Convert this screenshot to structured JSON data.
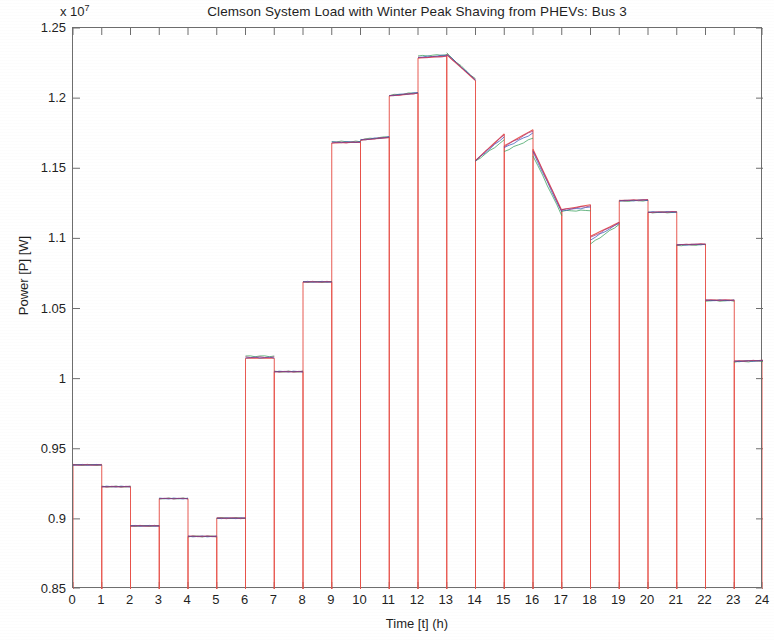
{
  "chart_data": {
    "type": "line",
    "title": "Clemson System Load with Winter Peak Shaving from PHEVs: Bus 3",
    "xlabel": "Time [t] (h)",
    "ylabel": "Power [P] [W]",
    "y_exponent_label": "x 10",
    "y_exponent_power": "7",
    "y_exponent_value": 10000000,
    "xlim": [
      0,
      24
    ],
    "ylim": [
      0.85,
      1.25
    ],
    "y_unit_note": "values in units of 1e7 W",
    "grid": false,
    "legend": "none",
    "xticks": [
      0,
      1,
      2,
      3,
      4,
      5,
      6,
      7,
      8,
      9,
      10,
      11,
      12,
      13,
      14,
      15,
      16,
      17,
      18,
      19,
      20,
      21,
      22,
      23,
      24
    ],
    "xtick_labels": [
      "0",
      "1",
      "2",
      "3",
      "4",
      "5",
      "6",
      "7",
      "8",
      "9",
      "10",
      "11",
      "12",
      "13",
      "14",
      "15",
      "16",
      "17",
      "18",
      "19",
      "20",
      "21",
      "22",
      "23",
      "24"
    ],
    "yticks": [
      0.85,
      0.9,
      0.95,
      1.0,
      1.05,
      1.1,
      1.15,
      1.2,
      1.25
    ],
    "ytick_labels": [
      "0.85",
      "0.9",
      "0.95",
      "1",
      "1.05",
      "1.1",
      "1.15",
      "1.2",
      "1.25"
    ],
    "colors": {
      "base_red": "#e8524a",
      "series_green": "#2e9b53",
      "series_blue": "#2c4fb5",
      "series_magenta": "#a8307c",
      "series_dark": "#4a4a4a",
      "axis": "#6e6e6e",
      "text": "#1f1f1f"
    },
    "hours": [
      {
        "hour": 0,
        "start": 0,
        "end": 1
      },
      {
        "hour": 1,
        "start": 1,
        "end": 2
      },
      {
        "hour": 2,
        "start": 2,
        "end": 3
      },
      {
        "hour": 3,
        "start": 3,
        "end": 4
      },
      {
        "hour": 4,
        "start": 4,
        "end": 5
      },
      {
        "hour": 5,
        "start": 5,
        "end": 6
      },
      {
        "hour": 6,
        "start": 6,
        "end": 7
      },
      {
        "hour": 7,
        "start": 7,
        "end": 8
      },
      {
        "hour": 8,
        "start": 8,
        "end": 9
      },
      {
        "hour": 9,
        "start": 9,
        "end": 10
      },
      {
        "hour": 10,
        "start": 10,
        "end": 11
      },
      {
        "hour": 11,
        "start": 11,
        "end": 12
      },
      {
        "hour": 12,
        "start": 12,
        "end": 13
      },
      {
        "hour": 13,
        "start": 13,
        "end": 14
      },
      {
        "hour": 14,
        "start": 14,
        "end": 15
      },
      {
        "hour": 15,
        "start": 15,
        "end": 16
      },
      {
        "hour": 16,
        "start": 16,
        "end": 17
      },
      {
        "hour": 17,
        "start": 17,
        "end": 18
      },
      {
        "hour": 18,
        "start": 18,
        "end": 19
      },
      {
        "hour": 19,
        "start": 19,
        "end": 20
      },
      {
        "hour": 20,
        "start": 20,
        "end": 21
      },
      {
        "hour": 21,
        "start": 21,
        "end": 22
      },
      {
        "hour": 22,
        "start": 22,
        "end": 23
      },
      {
        "hour": 23,
        "start": 23,
        "end": 24
      }
    ],
    "series": [
      {
        "name": "base-load",
        "color": "#e8524a",
        "style": "step-start",
        "values": [
          0.9385,
          0.923,
          0.895,
          0.9145,
          0.8875,
          0.9005,
          1.0145,
          1.005,
          1.069,
          1.168,
          1.17,
          1.2015,
          1.2285,
          1.231,
          1.1555,
          1.166,
          1.1635,
          1.1205,
          1.1015,
          1.127,
          1.1185,
          1.0955,
          1.056,
          1.0125
        ],
        "values_end": [
          0.9385,
          0.923,
          0.895,
          0.9145,
          0.8875,
          0.9005,
          1.0145,
          1.005,
          1.069,
          1.1685,
          1.172,
          1.2035,
          1.23,
          1.2125,
          1.1745,
          1.1775,
          1.12,
          1.124,
          1.1115,
          1.1275,
          1.119,
          1.096,
          1.056,
          1.013
        ]
      },
      {
        "name": "phev-shaved-green",
        "color": "#2e9b53",
        "style": "step-start",
        "values": [
          0.9385,
          0.923,
          0.895,
          0.9145,
          0.8875,
          0.9005,
          1.016,
          1.005,
          1.069,
          1.169,
          1.1705,
          1.202,
          1.23,
          1.232,
          1.155,
          1.162,
          1.159,
          1.1195,
          1.096,
          1.1265,
          1.1185,
          1.095,
          1.0555,
          1.012
        ],
        "values_end": [
          0.9385,
          0.923,
          0.895,
          0.9145,
          0.8875,
          0.9005,
          1.016,
          1.005,
          1.069,
          1.169,
          1.1725,
          1.204,
          1.231,
          1.2135,
          1.17,
          1.1715,
          1.1165,
          1.12,
          1.11,
          1.127,
          1.1185,
          1.0955,
          1.0555,
          1.0125
        ]
      },
      {
        "name": "phev-shaved-blue",
        "color": "#2c4fb5",
        "style": "step-start",
        "values": [
          0.9385,
          0.923,
          0.895,
          0.9145,
          0.8875,
          0.9005,
          1.015,
          1.005,
          1.069,
          1.1685,
          1.1702,
          1.2018,
          1.2292,
          1.2315,
          1.1553,
          1.1645,
          1.1615,
          1.12,
          1.099,
          1.1268,
          1.1187,
          1.0953,
          1.0558,
          1.0123
        ],
        "values_end": [
          0.9385,
          0.923,
          0.895,
          0.9145,
          0.8875,
          0.9005,
          1.015,
          1.005,
          1.069,
          1.1688,
          1.1723,
          1.2038,
          1.2305,
          1.213,
          1.1725,
          1.175,
          1.1185,
          1.1222,
          1.1108,
          1.1273,
          1.1188,
          1.0958,
          1.0558,
          1.0128
        ]
      },
      {
        "name": "phev-shaved-magenta",
        "color": "#a8307c",
        "style": "step-start",
        "values": [
          0.9385,
          0.923,
          0.895,
          0.9145,
          0.8875,
          0.9005,
          1.0152,
          1.005,
          1.069,
          1.1683,
          1.1701,
          1.2016,
          1.2288,
          1.2312,
          1.1556,
          1.1655,
          1.1628,
          1.1203,
          1.1005,
          1.1269,
          1.1186,
          1.0954,
          1.0559,
          1.0124
        ],
        "values_end": [
          0.9385,
          0.923,
          0.895,
          0.9145,
          0.8875,
          0.9005,
          1.0152,
          1.005,
          1.069,
          1.1686,
          1.1721,
          1.2036,
          1.2298,
          1.2128,
          1.1738,
          1.1768,
          1.1194,
          1.1232,
          1.1112,
          1.1274,
          1.1189,
          1.0959,
          1.0559,
          1.0129
        ]
      }
    ]
  }
}
